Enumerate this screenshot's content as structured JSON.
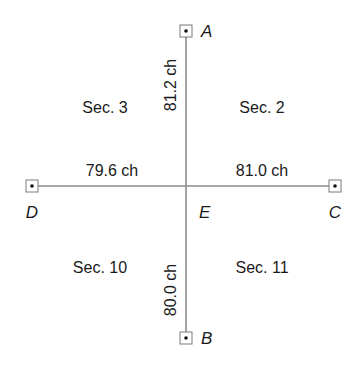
{
  "diagram": {
    "type": "survey-section-corner-diagram",
    "points": [
      {
        "id": "A",
        "label": "A",
        "x": 186,
        "y": 31
      },
      {
        "id": "B",
        "label": "B",
        "x": 186,
        "y": 338
      },
      {
        "id": "C",
        "label": "C",
        "x": 335,
        "y": 186
      },
      {
        "id": "D",
        "label": "D",
        "x": 32,
        "y": 186
      },
      {
        "id": "E",
        "label": "E",
        "x": 186,
        "y": 186
      }
    ],
    "distances": {
      "EA": "81.2 ch",
      "EB": "80.0 ch",
      "ED": "79.6 ch",
      "EC": "81.0 ch"
    },
    "sections": {
      "nw": "Sec. 3",
      "ne": "Sec. 2",
      "sw": "Sec. 10",
      "se": "Sec. 11"
    },
    "colors": {
      "line": "#8c8c8c",
      "text": "#1a1a1a",
      "marker_border": "#7a7a7a",
      "background": "#ffffff"
    }
  }
}
